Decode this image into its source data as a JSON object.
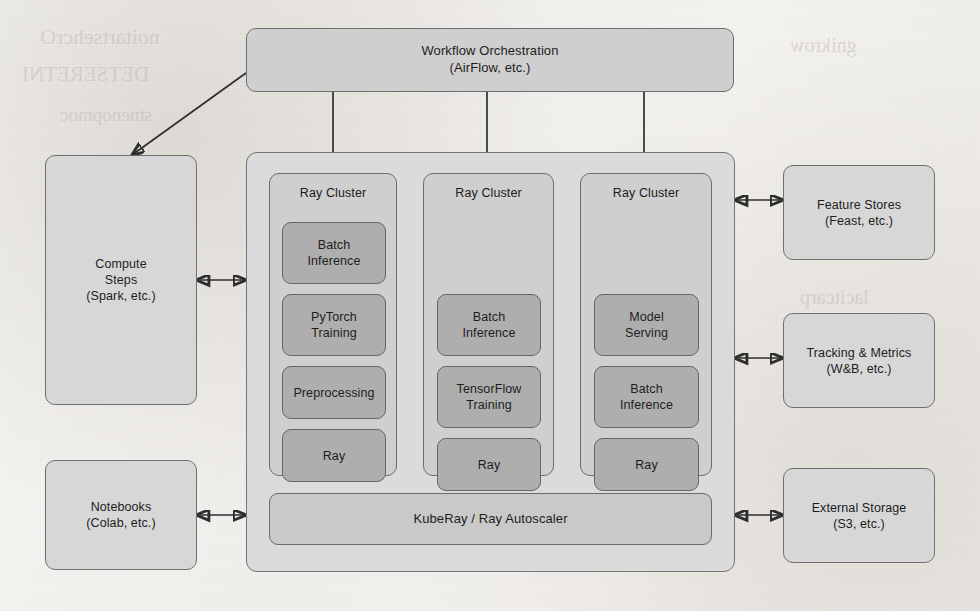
{
  "diagram": {
    "colors": {
      "page_background": "#f4f3f1",
      "frame_fill": "#dbdbdb",
      "cluster_fill": "#cfcfcf",
      "chip_fill": "#aeaeae",
      "external_fill": "#d7d7d7",
      "bar_fill": "#c9c9c9",
      "stroke": "#6f6f6f",
      "arrow": "#2e2e2e",
      "text": "#1d1d1d"
    },
    "orchestration": {
      "line1": "Workflow Orchestration",
      "line2": "(AirFlow, etc.)"
    },
    "left_boxes": [
      {
        "line1": "Compute",
        "line2": "Steps",
        "line3": "(Spark, etc.)"
      },
      {
        "line1": "Notebooks",
        "line2": "(Colab, etc.)"
      }
    ],
    "right_boxes": [
      {
        "line1": "Feature Stores",
        "line2": "(Feast, etc.)"
      },
      {
        "line1": "Tracking & Metrics",
        "line2": "(W&B, etc.)"
      },
      {
        "line1": "External Storage",
        "line2": "(S3, etc.)"
      }
    ],
    "clusters": [
      {
        "title": "Ray Cluster",
        "chips": [
          {
            "line1": "Batch",
            "line2": "Inference"
          },
          {
            "line1": "PyTorch",
            "line2": "Training"
          },
          {
            "line1": "Preprocessing",
            "line2": ""
          },
          {
            "line1": "Ray",
            "line2": ""
          }
        ]
      },
      {
        "title": "Ray Cluster",
        "chips": [
          {
            "line1": "Batch",
            "line2": "Inference"
          },
          {
            "line1": "TensorFlow",
            "line2": "Training"
          },
          {
            "line1": "Ray",
            "line2": ""
          }
        ]
      },
      {
        "title": "Ray Cluster",
        "chips": [
          {
            "line1": "Model",
            "line2": "Serving"
          },
          {
            "line1": "Batch",
            "line2": "Inference"
          },
          {
            "line1": "Ray",
            "line2": ""
          }
        ]
      }
    ],
    "autoscaler_bar": {
      "label": "KubeRay / Ray Autoscaler"
    },
    "bleed_through": [
      "noitartsehcrO",
      "DETSERETNI",
      "stnenopmoc",
      "gnikrow",
      "lacitcarp"
    ]
  }
}
